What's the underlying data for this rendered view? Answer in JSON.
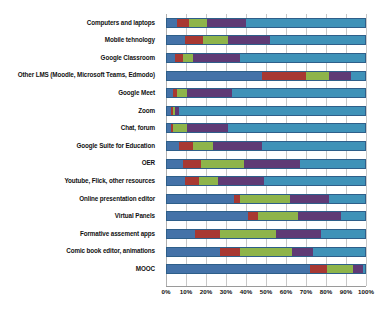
{
  "chart_data": {
    "type": "bar",
    "orientation": "horizontal",
    "stacked": true,
    "normalized": true,
    "title": "",
    "xlabel": "",
    "ylabel": "",
    "xlim": [
      0,
      100
    ],
    "grid": true,
    "legend": "none",
    "tick_labels": [
      "0%",
      "10%",
      "20%",
      "30%",
      "40%",
      "50%",
      "60%",
      "70%",
      "80%",
      "90%",
      "100%"
    ],
    "tick_values": [
      0,
      10,
      20,
      30,
      40,
      50,
      60,
      70,
      80,
      90,
      100
    ],
    "colors": [
      "#4472a8",
      "#a83832",
      "#8eb44a",
      "#5f3a75",
      "#3f92b8"
    ],
    "categories": [
      "Computers and laptops",
      "Mobile tehnology",
      "Google Classroom",
      "Other LMS (Moodle, Microsoft Teams, Edmodo)",
      "Google Meet",
      "Zoom",
      "Chat, forum",
      "Google Suite for Education",
      "OER",
      "Youtube, Flick, other resources",
      "Online presentation editor",
      "Virtual Panels",
      "Formative assement apps",
      "Comic book editor, animations",
      "MOOC"
    ],
    "series": [
      {
        "name": "series-1",
        "color": "#4472a8",
        "values": [
          5,
          9,
          4,
          48,
          3,
          2,
          2,
          6,
          8,
          9,
          34,
          41,
          14,
          27,
          72
        ]
      },
      {
        "name": "series-2",
        "color": "#a83832",
        "values": [
          6,
          9,
          4,
          22,
          2,
          1,
          1,
          7,
          9,
          7,
          3,
          5,
          13,
          10,
          9
        ]
      },
      {
        "name": "series-3",
        "color": "#8eb44a",
        "values": [
          9,
          13,
          5,
          12,
          5,
          1,
          7,
          10,
          22,
          10,
          25,
          20,
          28,
          26,
          13
        ]
      },
      {
        "name": "series-4",
        "color": "#5f3a75",
        "values": [
          20,
          21,
          24,
          11,
          23,
          2,
          21,
          25,
          28,
          23,
          20,
          22,
          23,
          11,
          5
        ]
      },
      {
        "name": "series-5",
        "color": "#3f92b8",
        "values": [
          60,
          48,
          63,
          7,
          67,
          94,
          69,
          52,
          33,
          51,
          18,
          12,
          22,
          26,
          1
        ]
      }
    ]
  }
}
